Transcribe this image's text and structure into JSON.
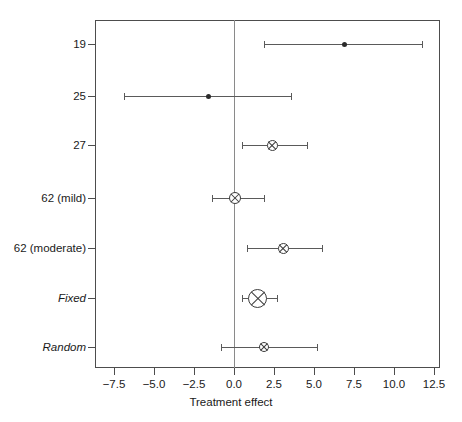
{
  "chart_data": {
    "type": "scatter",
    "subtype": "forest-plot",
    "title": "",
    "xlabel": "Treatment effect",
    "ylabel": "",
    "xlim": [
      -8.7,
      12.9
    ],
    "xticks": [
      -7.5,
      -5.0,
      -2.5,
      0.0,
      2.5,
      5.0,
      7.5,
      10.0,
      12.5
    ],
    "xticklabels": [
      "−7.5",
      "−5.0",
      "−2.5",
      "0.0",
      "2.5",
      "5.0",
      "7.5",
      "10.0",
      "12.5"
    ],
    "grid": false,
    "legend": null,
    "reference_line": 0.0,
    "categories": [
      "19",
      "25",
      "27",
      "62 (mild)",
      "62 (moderate)",
      "Fixed",
      "Random"
    ],
    "rows": [
      {
        "label": "19",
        "italic": false,
        "estimate": 6.9,
        "ci_low": 1.9,
        "ci_high": 11.8,
        "marker": "filled-dot",
        "marker_size": 5
      },
      {
        "label": "25",
        "italic": false,
        "estimate": -1.6,
        "ci_low": -6.9,
        "ci_high": 3.6,
        "marker": "filled-dot",
        "marker_size": 5
      },
      {
        "label": "27",
        "italic": false,
        "estimate": 2.4,
        "ci_low": 0.5,
        "ci_high": 4.6,
        "marker": "circle-cross",
        "marker_size": 11
      },
      {
        "label": "62 (mild)",
        "italic": false,
        "estimate": 0.05,
        "ci_low": -1.4,
        "ci_high": 1.9,
        "marker": "circle-cross",
        "marker_size": 12
      },
      {
        "label": "62 (moderate)",
        "italic": false,
        "estimate": 3.1,
        "ci_low": 0.8,
        "ci_high": 5.5,
        "marker": "circle-cross",
        "marker_size": 11
      },
      {
        "label": "Fixed",
        "italic": true,
        "estimate": 1.5,
        "ci_low": 0.5,
        "ci_high": 2.7,
        "marker": "circle-cross",
        "marker_size": 19
      },
      {
        "label": "Random",
        "italic": true,
        "estimate": 1.9,
        "ci_low": -0.8,
        "ci_high": 5.2,
        "marker": "circle-cross",
        "marker_size": 10
      }
    ],
    "colors": {
      "frame": "#4d4d4d",
      "reference_line": "#8a8a8a",
      "ci": "#5a5a5a",
      "marker": "#3d3d3d",
      "text": "#1a1a1a",
      "background": "#ffffff"
    }
  }
}
